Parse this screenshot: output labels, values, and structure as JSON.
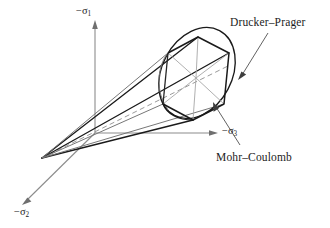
{
  "figure": {
    "title_present": false,
    "background_color": "#ffffff",
    "ink_color": "#1a1a1a",
    "axis_color": "#8c8c8c",
    "spoke_color": "#a6a6a6"
  },
  "axes": [
    {
      "id": "sigma1",
      "minus": "−",
      "symbol": "σ",
      "subscript": "1",
      "label": "−σ₁",
      "direction": "up",
      "origin": [
        95,
        133
      ],
      "tip": [
        95,
        22
      ]
    },
    {
      "id": "sigma2",
      "minus": "−",
      "symbol": "σ",
      "subscript": "2",
      "label": "−σ₂",
      "direction": "down-left",
      "origin": [
        95,
        133
      ],
      "tip": [
        22,
        205
      ]
    },
    {
      "id": "sigma3",
      "minus": "−",
      "symbol": "σ",
      "subscript": "3",
      "label": "−σ₃",
      "direction": "right",
      "origin": [
        95,
        133
      ],
      "tip": [
        218,
        133
      ]
    }
  ],
  "annotations": [
    {
      "id": "drucker-prager",
      "text": "Drucker–Prager",
      "text_pos": [
        230,
        17
      ],
      "points_to": [
        238,
        78
      ],
      "describes": "smooth circular cone cross-section"
    },
    {
      "id": "mohr-coulomb",
      "text": "Mohr–Coulomb",
      "text_pos": [
        216,
        152
      ],
      "points_to": [
        213,
        103
      ],
      "describes": "irregular hexagonal pyramid cross-section"
    }
  ],
  "geometry": {
    "apex": [
      42,
      158
    ],
    "hydrostatic_axis": {
      "from": [
        42,
        158
      ],
      "to": [
        228,
        66
      ],
      "style": "dashed"
    },
    "dp_ellipse": {
      "center": [
        197,
        73
      ],
      "rx": 35,
      "ry": 48,
      "rotation_deg": 28
    },
    "mc_hexagon_vertices": [
      [
        198,
        37
      ],
      [
        229,
        53
      ],
      [
        224,
        104
      ],
      [
        193,
        120
      ],
      [
        163,
        104
      ],
      [
        168,
        53
      ]
    ],
    "cone_generators": [
      {
        "from": [
          42,
          158
        ],
        "to": [
          198,
          37
        ]
      },
      {
        "from": [
          42,
          158
        ],
        "to": [
          229,
          53
        ]
      },
      {
        "from": [
          42,
          158
        ],
        "to": [
          224,
          104
        ]
      },
      {
        "from": [
          42,
          158
        ],
        "to": [
          193,
          120
        ]
      },
      {
        "from": [
          42,
          158
        ],
        "to": [
          163,
          104
        ]
      }
    ]
  }
}
